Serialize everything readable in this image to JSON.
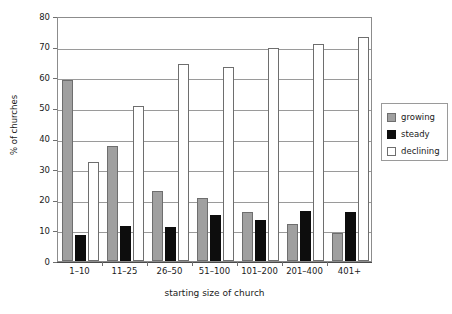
{
  "chart_data": {
    "type": "bar",
    "title": "",
    "xlabel": "starting size of church",
    "ylabel": "% of churches",
    "categories": [
      "1–10",
      "11–25",
      "26–50",
      "51–100",
      "101–200",
      "201–400",
      "401+"
    ],
    "series": [
      {
        "name": "growing",
        "color": "#a0a0a0",
        "values": [
          59,
          37.5,
          23,
          20.5,
          16,
          12,
          9
        ]
      },
      {
        "name": "steady",
        "color": "#0d0d0d",
        "values": [
          8.5,
          11.5,
          11,
          15,
          13.5,
          16.5,
          16
        ]
      },
      {
        "name": "declining",
        "color": "#ffffff",
        "values": [
          32.5,
          50.5,
          64.5,
          63.5,
          69.5,
          71,
          73
        ]
      }
    ],
    "ylim": [
      0,
      80
    ],
    "ytick_step": 10,
    "yticks": [
      0,
      10,
      20,
      30,
      40,
      50,
      60,
      70,
      80
    ],
    "ytick_labels": [
      "0",
      "10",
      "20",
      "30",
      "40",
      "50",
      "60",
      "70",
      "80"
    ],
    "grid": true,
    "grid_axis": "y",
    "legend_position": "right",
    "legend_entries": [
      "growing",
      "steady",
      "declining"
    ]
  }
}
